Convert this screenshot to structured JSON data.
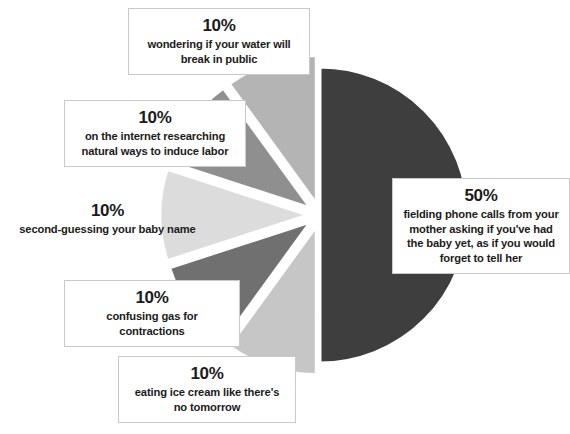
{
  "chart_data": {
    "type": "pie",
    "title": "",
    "subtitle": "",
    "xlabel": "",
    "ylabel": "",
    "legend_position": "callout-labels",
    "grid": false,
    "total": 100,
    "unit": "%",
    "center": {
      "x": 320,
      "y": 215
    },
    "radius": 148,
    "categories": [
      "fielding phone calls from your mother asking if you've had the baby yet, as if you would forget to tell her",
      "wondering if your water will break in public",
      "on the internet researching natural ways to induce labor",
      "second-guessing your baby name",
      "confusing gas for contractions",
      "eating ice cream like there's no tomorrow"
    ],
    "values": [
      50,
      10,
      10,
      10,
      10,
      10
    ],
    "slices": [
      {
        "id": "phone-calls",
        "percent_label": "50%",
        "value": 50,
        "description": "fielding phone calls from your mother asking if you've had the baby yet, as if you would forget to tell her",
        "color": "#3e3e3e",
        "start_angle_deg": -90,
        "end_angle_deg": 90,
        "explode": 0
      },
      {
        "id": "water-break",
        "percent_label": "10%",
        "value": 10,
        "description": "wondering if your water will break in public",
        "color": "#b4b4b4",
        "start_angle_deg": -90,
        "end_angle_deg": -126,
        "explode": 12
      },
      {
        "id": "internet-research",
        "percent_label": "10%",
        "value": 10,
        "description": "on the internet researching natural ways to induce labor",
        "color": "#8f8f8f",
        "start_angle_deg": -126,
        "end_angle_deg": -162,
        "explode": 12
      },
      {
        "id": "baby-name",
        "percent_label": "10%",
        "value": 10,
        "description": "second-guessing your baby name",
        "color": "#dcdcdc",
        "start_angle_deg": -162,
        "end_angle_deg": -198,
        "explode": 12
      },
      {
        "id": "gas-contractions",
        "percent_label": "10%",
        "value": 10,
        "description": "confusing gas for contractions",
        "color": "#707070",
        "start_angle_deg": -198,
        "end_angle_deg": -234,
        "explode": 12
      },
      {
        "id": "ice-cream",
        "percent_label": "10%",
        "value": 10,
        "description": "eating ice cream like there's no tomorrow",
        "color": "#c6c6c6",
        "start_angle_deg": -234,
        "end_angle_deg": -270,
        "explode": 12
      }
    ],
    "colors": {
      "background": "#ffffff",
      "text": "#1b1b1b",
      "callout_border": "#c9c9c9",
      "slice_gap": "#ffffff"
    }
  },
  "callouts": {
    "water": {
      "percent": "10%",
      "description": "wondering if your water will break in public"
    },
    "internet": {
      "percent": "10%",
      "description": "on the internet researching natural ways to induce labor"
    },
    "babyname": {
      "percent": "10%",
      "description": "second-guessing your baby name"
    },
    "gas": {
      "percent": "10%",
      "description": "confusing gas for contractions"
    },
    "icecream": {
      "percent": "10%",
      "description": "eating ice cream like there's no tomorrow"
    },
    "phone": {
      "percent": "50%",
      "description": "fielding phone calls from your mother asking if you've had the baby yet, as if you would forget to tell her"
    }
  }
}
